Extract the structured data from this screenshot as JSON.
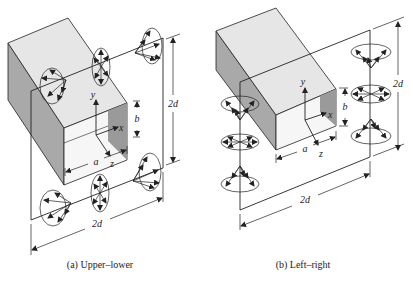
{
  "figure": {
    "panels": [
      {
        "id": "a",
        "caption": "(a)  Upper–lower",
        "labels": {
          "axis_x": "x",
          "axis_y": "y",
          "axis_z": "z",
          "dim_a": "a",
          "dim_b": "b",
          "dim_height": "2d",
          "dim_width": "2d"
        },
        "radiators": "upper and lower edges"
      },
      {
        "id": "b",
        "caption": "(b)  Left–right",
        "labels": {
          "axis_x": "x",
          "axis_y": "y",
          "axis_z": "z",
          "dim_a": "a",
          "dim_b": "b",
          "dim_height": "2d",
          "dim_width": "2d"
        },
        "radiators": "left and right edges"
      }
    ],
    "colors": {
      "line": "#222222",
      "box_top": "#e6e6e6",
      "box_side": "#a9a9a9",
      "box_front": "#f4f4f4",
      "inner_shade": "#9a9a9a"
    }
  }
}
